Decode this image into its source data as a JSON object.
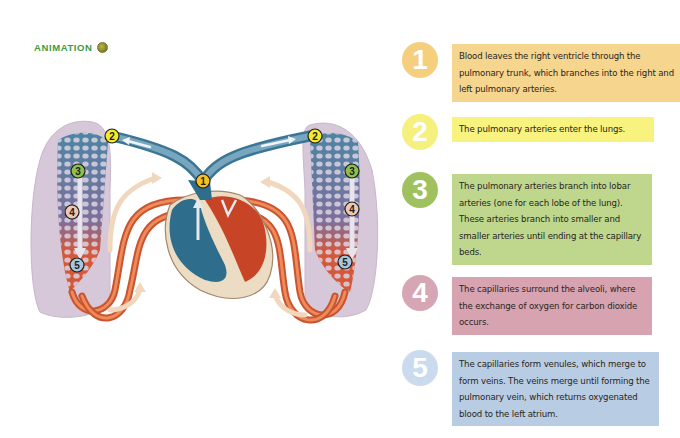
{
  "header": {
    "label": "ANIMATION",
    "icon": "animation-play-icon"
  },
  "diagram": {
    "markers": [
      {
        "n": "1",
        "color": "#f3c21f"
      },
      {
        "n": "2",
        "color": "#f4ea2a"
      },
      {
        "n": "3",
        "color": "#8cc04a"
      },
      {
        "n": "4",
        "color": "#f1c6b1"
      },
      {
        "n": "5",
        "color": "#a9c6dc"
      }
    ],
    "colors": {
      "deoxygenated": "#3f7a9a",
      "oxygenated": "#d5522e",
      "lung": "#c5b1c8",
      "flow_arrow": "#f2d7bf"
    }
  },
  "steps": [
    {
      "number": "1",
      "badge_color": "#f5cf7e",
      "box_color": "#f6d58f",
      "text": "Blood leaves the right ventricle through the pulmonary trunk, which branches into the right and left pulmonary arteries."
    },
    {
      "number": "2",
      "badge_color": "#f6f07e",
      "box_color": "#f8f27e",
      "text": "The pulmonary arteries enter the lungs."
    },
    {
      "number": "3",
      "badge_color": "#9fc25e",
      "box_color": "#bed78c",
      "text": "The pulmonary arteries branch into lobar arteries (one for each lobe of the lung). These arteries branch into smaller and smaller arteries until ending at the capillary beds."
    },
    {
      "number": "4",
      "badge_color": "#d7a6b4",
      "box_color": "#d7a3b1",
      "text": "The capillaries surround the alveoli, where the exchange of oxygen for carbon dioxide occurs."
    },
    {
      "number": "5",
      "badge_color": "#c9dbec",
      "box_color": "#b8cde3",
      "text": "The capillaries form venules, which merge to form veins. The veins merge until forming the pulmonary vein, which returns oxygenated blood to the left atrium."
    }
  ]
}
